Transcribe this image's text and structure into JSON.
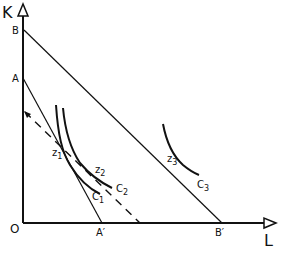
{
  "diagram": {
    "axes": {
      "y_label": "K",
      "x_label": "L",
      "origin_label": "O"
    },
    "points": {
      "B": "B",
      "A": "A",
      "A_prime": "A′",
      "B_prime": "B′"
    },
    "tangency_points": [
      {
        "base": "z",
        "sub": "1"
      },
      {
        "base": "z",
        "sub": "2"
      },
      {
        "base": "z",
        "sub": "3"
      }
    ],
    "isoquants": [
      {
        "base": "C",
        "sub": "1"
      },
      {
        "base": "C",
        "sub": "2"
      },
      {
        "base": "C",
        "sub": "3"
      }
    ],
    "lines": [
      {
        "name": "budget-line-AA'",
        "from": "A",
        "to": "A′",
        "style": "solid"
      },
      {
        "name": "budget-line-BB'",
        "from": "B",
        "to": "B′",
        "style": "solid"
      },
      {
        "name": "shifted-budget-line",
        "style": "dashed"
      }
    ],
    "colors": {
      "ink": "#111111",
      "background": "#ffffff"
    }
  }
}
